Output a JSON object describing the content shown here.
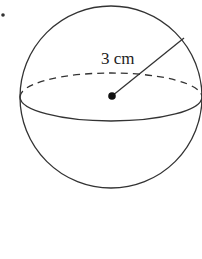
{
  "figure": {
    "shape": "sphere",
    "radius_label": "3 cm",
    "colors": {
      "stroke": "#333333",
      "background": "#ffffff"
    }
  }
}
